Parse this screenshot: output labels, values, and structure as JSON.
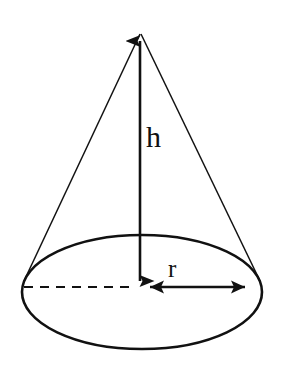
{
  "figure": {
    "type": "geometry-diagram",
    "shape": "cone",
    "width": 283,
    "height": 365,
    "background_color": "#ffffff",
    "stroke_color": "#111111"
  },
  "labels": {
    "height_label": "h",
    "radius_label": "r"
  },
  "geometry": {
    "apex": {
      "x": 140,
      "y": 31
    },
    "base_ellipse": {
      "cx": 142,
      "cy": 292,
      "rx": 120,
      "ry": 57
    },
    "left_slant_end": {
      "x": 24,
      "y": 280
    },
    "right_slant_end": {
      "x": 260,
      "y": 280
    },
    "height_segment": {
      "x1": 140,
      "y1": 33,
      "x2": 140,
      "y2": 288
    },
    "radius_segment": {
      "x1": 142,
      "y1": 287,
      "x2": 258,
      "y2": 287
    },
    "dashed_segment": {
      "x1": 24,
      "y1": 287,
      "x2": 136,
      "y2": 287
    },
    "dash_pattern": "9 7"
  }
}
